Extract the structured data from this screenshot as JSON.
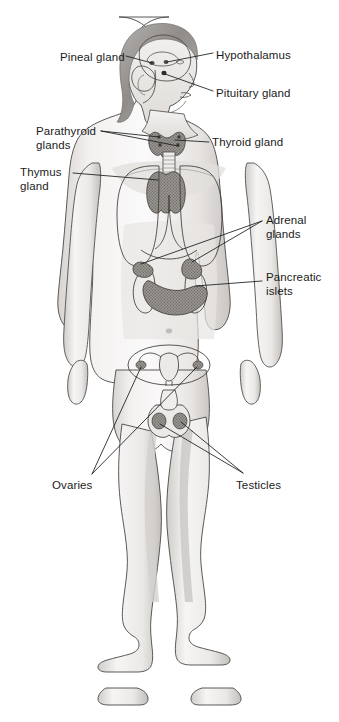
{
  "figure": {
    "view": "anterior full-body figure with lateral head inset",
    "style": "grayscale pencil medical illustration",
    "canvas": {
      "width": 339,
      "height": 722
    },
    "colors": {
      "background": "#ffffff",
      "outline": "#2b2b2b",
      "skin_light": "#f7f6f5",
      "skin_shade": "#d8d6d4",
      "skin_shade_deep": "#b9b6b3",
      "hair": "#9e9b98",
      "organ_fill": "#9a9794",
      "organ_dark": "#6d6a67",
      "leader_line": "#1b1b1b",
      "label_text": "#1b1b1b"
    }
  },
  "labels": [
    {
      "id": "pineal-gland",
      "text": "Pineal gland",
      "lines": [
        "Pineal gland"
      ],
      "side": "left",
      "x": 60,
      "y": 51
    },
    {
      "id": "hypothalamus",
      "text": "Hypothalamus",
      "lines": [
        "Hypothalamus"
      ],
      "side": "right",
      "x": 216,
      "y": 49
    },
    {
      "id": "pituitary-gland",
      "text": "Pituitary gland",
      "lines": [
        "Pituitary gland"
      ],
      "side": "right",
      "x": 216,
      "y": 87
    },
    {
      "id": "parathyroid-glands",
      "text": "Parathyroid glands",
      "lines": [
        "Parathyroid",
        "glands"
      ],
      "side": "left",
      "x": 36,
      "y": 125
    },
    {
      "id": "thyroid-gland",
      "text": "Thyroid gland",
      "lines": [
        "Thyroid gland"
      ],
      "side": "right",
      "x": 212,
      "y": 136
    },
    {
      "id": "thymus-gland",
      "text": "Thymus gland",
      "lines": [
        "Thymus",
        "gland"
      ],
      "side": "left",
      "x": 20,
      "y": 166
    },
    {
      "id": "adrenal-glands",
      "text": "Adrenal glands",
      "lines": [
        "Adrenal",
        "glands"
      ],
      "side": "right",
      "x": 266,
      "y": 214
    },
    {
      "id": "pancreatic-islets",
      "text": "Pancreatic islets",
      "lines": [
        "Pancreatic",
        "islets"
      ],
      "side": "right",
      "x": 266,
      "y": 271
    },
    {
      "id": "ovaries",
      "text": "Ovaries",
      "lines": [
        "Ovaries"
      ],
      "side": "left",
      "x": 52,
      "y": 479
    },
    {
      "id": "testicles",
      "text": "Testicles",
      "lines": [
        "Testicles"
      ],
      "side": "right",
      "x": 236,
      "y": 479
    }
  ],
  "organs": [
    {
      "id": "brain",
      "name": "brain outline"
    },
    {
      "id": "cerebellum",
      "name": "cerebellum"
    },
    {
      "id": "pineal",
      "name": "pineal gland marker"
    },
    {
      "id": "hypothalamus",
      "name": "hypothalamus marker"
    },
    {
      "id": "pituitary",
      "name": "pituitary gland marker"
    },
    {
      "id": "thyroid",
      "name": "thyroid gland"
    },
    {
      "id": "parathyroid",
      "name": "parathyroid glands"
    },
    {
      "id": "trachea",
      "name": "trachea"
    },
    {
      "id": "thymus",
      "name": "thymus gland"
    },
    {
      "id": "lungs",
      "name": "lung outlines"
    },
    {
      "id": "diaphragm",
      "name": "diaphragm outline"
    },
    {
      "id": "kidneys",
      "name": "kidneys"
    },
    {
      "id": "adrenals",
      "name": "adrenal glands"
    },
    {
      "id": "pancreas",
      "name": "pancreas"
    },
    {
      "id": "uterus-inset",
      "name": "uterus and ovaries inset"
    },
    {
      "id": "testes",
      "name": "testicles"
    }
  ]
}
